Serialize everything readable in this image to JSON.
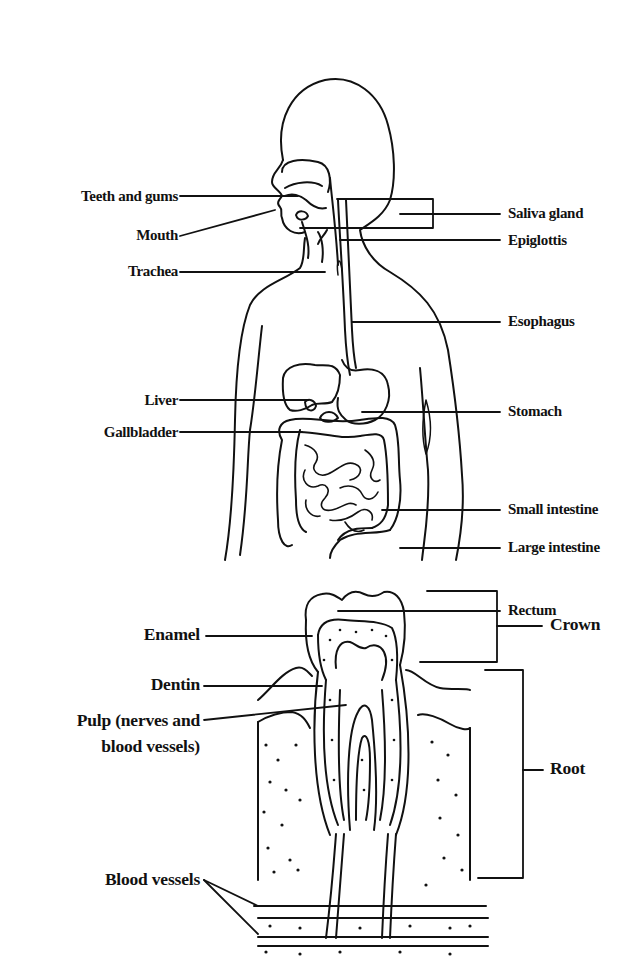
{
  "digestive_system": {
    "left_labels": {
      "teeth_and_gums": "Teeth and gums",
      "mouth": "Mouth",
      "trachea": "Trachea",
      "liver": "Liver",
      "gallbladder": "Gallbladder"
    },
    "right_labels": {
      "saliva_gland": "Saliva gland",
      "epiglottis": "Epiglottis",
      "esophagus": "Esophagus",
      "stomach": "Stomach",
      "small_intestine": "Small intestine",
      "large_intestine": "Large intestine",
      "rectum": "Rectum"
    }
  },
  "tooth": {
    "left_labels": {
      "enamel": "Enamel",
      "dentin": "Dentin",
      "pulp_line1": "Pulp (nerves and",
      "pulp_line2": "blood vessels)",
      "blood_vessels": "Blood vessels"
    },
    "right_labels": {
      "crown": "Crown",
      "root": "Root"
    }
  },
  "colors": {
    "ink": "#111111",
    "background": "#ffffff"
  }
}
